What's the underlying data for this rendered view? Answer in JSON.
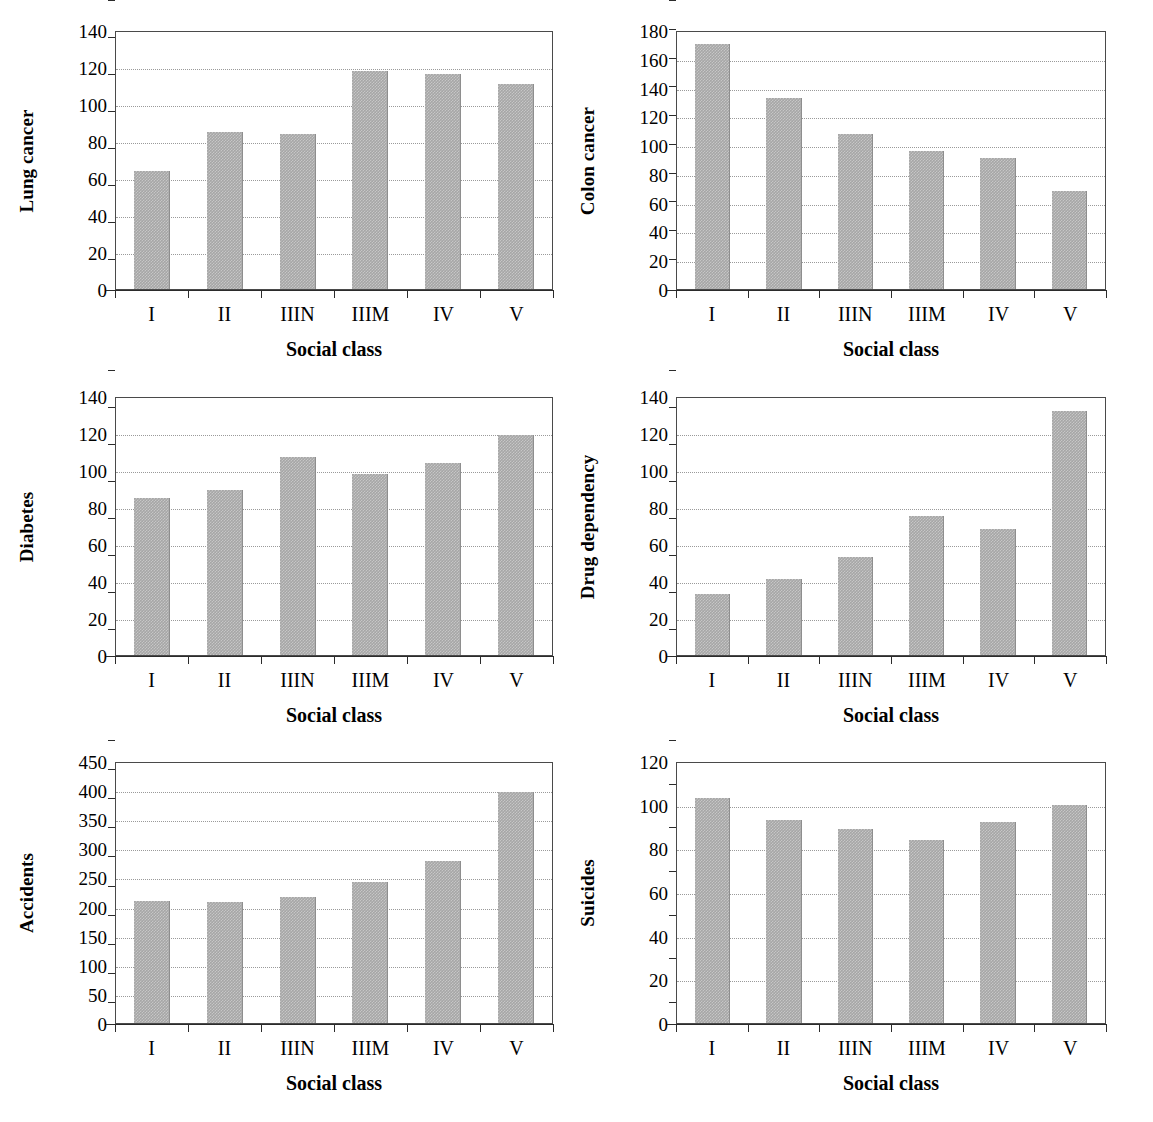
{
  "figure": {
    "shared_xlabel": "Social class",
    "categories": [
      "I",
      "II",
      "IIIN",
      "IIIM",
      "IV",
      "V"
    ],
    "bar_color": "#a6a6a6",
    "grid": true,
    "legend": "none"
  },
  "chart_data": [
    {
      "id": "lung-cancer",
      "type": "bar",
      "title": "",
      "ylabel": "Lung cancer",
      "xlabel": "Social class",
      "categories": [
        "I",
        "II",
        "IIIN",
        "IIIM",
        "IV",
        "V"
      ],
      "values": [
        64,
        85,
        84,
        118,
        116,
        111
      ],
      "ylim": [
        0,
        140
      ],
      "yticks": [
        0,
        20,
        40,
        60,
        80,
        100,
        120,
        140
      ],
      "grid": true,
      "legend": "none"
    },
    {
      "id": "colon-cancer",
      "type": "bar",
      "title": "",
      "ylabel": "Colon cancer",
      "xlabel": "Social class",
      "categories": [
        "I",
        "II",
        "IIIN",
        "IIIM",
        "IV",
        "V"
      ],
      "values": [
        170,
        133,
        108,
        96,
        91,
        68
      ],
      "ylim": [
        0,
        180
      ],
      "yticks": [
        0,
        20,
        40,
        60,
        80,
        100,
        120,
        140,
        160,
        180
      ],
      "grid": true,
      "legend": "none"
    },
    {
      "id": "diabetes",
      "type": "bar",
      "title": "",
      "ylabel": "Diabetes",
      "xlabel": "Social class",
      "categories": [
        "I",
        "II",
        "IIIN",
        "IIIM",
        "IV",
        "V"
      ],
      "values": [
        85,
        89,
        107,
        98,
        104,
        119
      ],
      "ylim": [
        0,
        140
      ],
      "yticks": [
        0,
        20,
        40,
        60,
        80,
        100,
        120,
        140
      ],
      "grid": true,
      "legend": "none"
    },
    {
      "id": "drug-dependency",
      "type": "bar",
      "title": "",
      "ylabel": "Drug dependency",
      "xlabel": "Social class",
      "categories": [
        "I",
        "II",
        "IIIN",
        "IIIM",
        "IV",
        "V"
      ],
      "values": [
        33,
        41,
        53,
        75,
        68,
        132
      ],
      "ylim": [
        0,
        140
      ],
      "yticks": [
        0,
        20,
        40,
        60,
        80,
        100,
        120,
        140
      ],
      "grid": true,
      "legend": "none"
    },
    {
      "id": "accidents",
      "type": "bar",
      "title": "",
      "ylabel": "Accidents",
      "xlabel": "Social class",
      "categories": [
        "I",
        "II",
        "IIIN",
        "IIIM",
        "IV",
        "V"
      ],
      "values": [
        209,
        208,
        217,
        243,
        278,
        397
      ],
      "ylim": [
        0,
        450
      ],
      "yticks": [
        0,
        50,
        100,
        150,
        200,
        250,
        300,
        350,
        400,
        450
      ],
      "grid": true,
      "legend": "none"
    },
    {
      "id": "suicides",
      "type": "bar",
      "title": "",
      "ylabel": "Suicides",
      "xlabel": "Social class",
      "categories": [
        "I",
        "II",
        "IIIN",
        "IIIM",
        "IV",
        "V"
      ],
      "values": [
        103,
        93,
        89,
        84,
        92,
        100
      ],
      "ylim": [
        0,
        120
      ],
      "yticks": [
        0,
        20,
        40,
        60,
        80,
        100,
        120
      ],
      "grid": true,
      "legend": "none"
    }
  ]
}
